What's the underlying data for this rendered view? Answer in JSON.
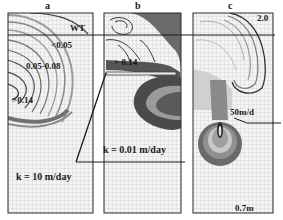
{
  "figure": {
    "panels": [
      {
        "letter": "a",
        "conductivity_label": "k = 10 m/day",
        "contour_labels": [
          "WT",
          "<0.05",
          "0.05-0.08",
          ">0.14"
        ]
      },
      {
        "letter": "b",
        "conductivity_label": "k = 0.01 m/day",
        "contour_labels": [
          ">0.14"
        ]
      },
      {
        "letter": "c",
        "conductivity_label": "50m/d",
        "contour_labels": [
          "2.0"
        ]
      }
    ],
    "annotations": {
      "water_table": "WT",
      "panel_a_low": "<0.05",
      "panel_a_mid": "0.05-0.08",
      "panel_a_high": ">0.14",
      "panel_b_high": "> 0.14",
      "panel_c_top": "2.0",
      "panel_c_bottom": "0.7m",
      "k_high": "k = 10 m/day",
      "k_low": "k = 0.01 m/day",
      "k_c": "50m/d"
    },
    "colors": {
      "grid": "#b9b9b9",
      "frame": "#2a2a2a",
      "contour_dark": "#3a3a3a",
      "contour_mid": "#7a7a7a",
      "contour_light": "#b0b0b0"
    }
  }
}
